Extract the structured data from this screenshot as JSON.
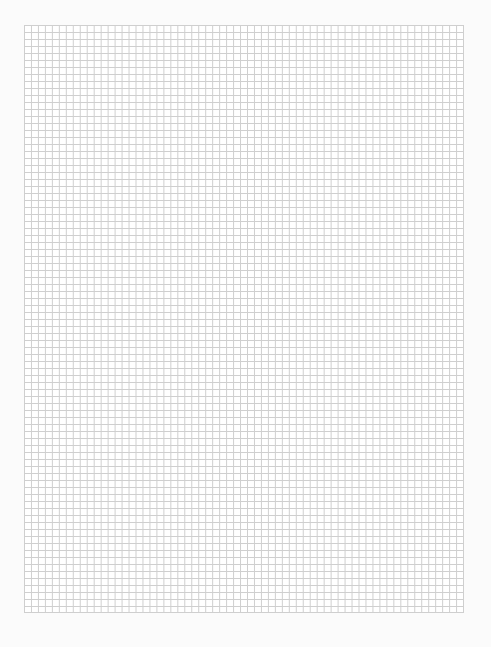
{
  "document": {
    "type": "graph-paper",
    "grid": {
      "columns": 63,
      "rows": 84,
      "line_color": "#cfcfcf",
      "background_color": "#ffffff"
    },
    "page_color": "#fbfbfb"
  }
}
